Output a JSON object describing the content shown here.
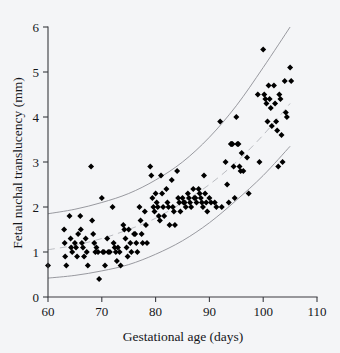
{
  "figure": {
    "background_color": "#f4f5f7",
    "point_color": "#000000",
    "curve_color": "#8d8f95",
    "axis_color": "#3a3b40"
  },
  "axes": {
    "x_title": "Gestational age (days)",
    "y_title": "Fetal nuchal translucency (mm)",
    "x_ticks": [
      "60",
      "70",
      "80",
      "90",
      "100",
      "110"
    ],
    "y_ticks": [
      "0",
      "1",
      "2",
      "3",
      "4",
      "5",
      "6"
    ]
  },
  "chart_data": {
    "type": "scatter",
    "title": "",
    "xlabel": "Gestational age (days)",
    "ylabel": "Fetal nuchal translucency (mm)",
    "xlim": [
      60,
      110
    ],
    "ylim": [
      0,
      6
    ],
    "xticks": [
      60,
      70,
      80,
      90,
      100,
      110
    ],
    "yticks": [
      0,
      1,
      2,
      3,
      4,
      5,
      6
    ],
    "grid": false,
    "legend": null,
    "marker": "diamond",
    "marker_color": "#000000",
    "points": [
      [
        60.0,
        0.7
      ],
      [
        63.0,
        1.5
      ],
      [
        63.1,
        1.2
      ],
      [
        63.2,
        0.9
      ],
      [
        63.4,
        0.7
      ],
      [
        64.0,
        1.8
      ],
      [
        64.2,
        1.3
      ],
      [
        64.3,
        1.1
      ],
      [
        64.5,
        1.0
      ],
      [
        65.0,
        1.2
      ],
      [
        65.2,
        1.1
      ],
      [
        65.4,
        0.9
      ],
      [
        65.6,
        1.4
      ],
      [
        66.0,
        1.8
      ],
      [
        66.1,
        1.5
      ],
      [
        66.3,
        1.2
      ],
      [
        66.5,
        1.1
      ],
      [
        66.7,
        0.9
      ],
      [
        67.0,
        1.3
      ],
      [
        67.2,
        1.0
      ],
      [
        67.4,
        0.7
      ],
      [
        68.0,
        2.9
      ],
      [
        68.2,
        1.7
      ],
      [
        68.4,
        1.4
      ],
      [
        68.6,
        1.2
      ],
      [
        68.8,
        1.0
      ],
      [
        69.0,
        1.1
      ],
      [
        69.3,
        1.0
      ],
      [
        69.5,
        0.4
      ],
      [
        70.0,
        2.2
      ],
      [
        70.2,
        1.0
      ],
      [
        70.4,
        1.0
      ],
      [
        70.6,
        0.7
      ],
      [
        71.0,
        1.3
      ],
      [
        71.2,
        1.0
      ],
      [
        71.5,
        1.0
      ],
      [
        72.0,
        2.0
      ],
      [
        72.2,
        1.2
      ],
      [
        72.4,
        1.1
      ],
      [
        72.6,
        1.0
      ],
      [
        72.8,
        0.8
      ],
      [
        73.0,
        1.1
      ],
      [
        73.3,
        1.0
      ],
      [
        73.5,
        0.7
      ],
      [
        74.0,
        1.6
      ],
      [
        74.2,
        1.5
      ],
      [
        74.4,
        1.3
      ],
      [
        74.6,
        1.1
      ],
      [
        74.8,
        0.9
      ],
      [
        75.0,
        1.5
      ],
      [
        75.3,
        1.2
      ],
      [
        75.5,
        1.0
      ],
      [
        76.0,
        1.4
      ],
      [
        76.2,
        1.4
      ],
      [
        76.4,
        1.2
      ],
      [
        76.6,
        1.0
      ],
      [
        77.0,
        2.0
      ],
      [
        77.2,
        1.7
      ],
      [
        77.4,
        1.4
      ],
      [
        77.6,
        1.2
      ],
      [
        78.0,
        1.9
      ],
      [
        78.2,
        1.6
      ],
      [
        78.4,
        1.2
      ],
      [
        79.0,
        2.9
      ],
      [
        79.2,
        2.7
      ],
      [
        79.4,
        2.2
      ],
      [
        79.6,
        2.0
      ],
      [
        79.8,
        1.9
      ],
      [
        80.0,
        2.3
      ],
      [
        80.2,
        2.1
      ],
      [
        80.4,
        2.0
      ],
      [
        80.6,
        1.8
      ],
      [
        80.8,
        1.7
      ],
      [
        81.0,
        2.7
      ],
      [
        81.2,
        2.3
      ],
      [
        81.4,
        2.0
      ],
      [
        81.6,
        1.8
      ],
      [
        82.0,
        2.4
      ],
      [
        82.2,
        2.1
      ],
      [
        82.4,
        2.0
      ],
      [
        82.6,
        1.6
      ],
      [
        83.0,
        2.6
      ],
      [
        83.2,
        2.0
      ],
      [
        83.4,
        1.9
      ],
      [
        83.6,
        1.6
      ],
      [
        84.0,
        2.8
      ],
      [
        84.2,
        2.2
      ],
      [
        84.4,
        2.1
      ],
      [
        84.6,
        1.9
      ],
      [
        85.0,
        2.2
      ],
      [
        85.2,
        2.1
      ],
      [
        85.4,
        2.1
      ],
      [
        85.6,
        2.0
      ],
      [
        86.0,
        2.3
      ],
      [
        86.2,
        2.2
      ],
      [
        86.4,
        2.1
      ],
      [
        86.6,
        2.0
      ],
      [
        87.0,
        2.4
      ],
      [
        87.2,
        2.2
      ],
      [
        87.4,
        2.2
      ],
      [
        87.6,
        2.1
      ],
      [
        88.0,
        2.4
      ],
      [
        88.2,
        2.3
      ],
      [
        88.4,
        2.2
      ],
      [
        88.6,
        2.1
      ],
      [
        88.8,
        2.0
      ],
      [
        89.0,
        2.7
      ],
      [
        89.2,
        2.3
      ],
      [
        89.4,
        2.1
      ],
      [
        89.6,
        1.9
      ],
      [
        90.0,
        2.2
      ],
      [
        90.3,
        2.1
      ],
      [
        91.0,
        2.1
      ],
      [
        91.3,
        2.0
      ],
      [
        92.0,
        3.9
      ],
      [
        92.3,
        2.0
      ],
      [
        93.0,
        3.0
      ],
      [
        93.3,
        2.5
      ],
      [
        93.6,
        2.1
      ],
      [
        94.0,
        3.4
      ],
      [
        94.1,
        3.4
      ],
      [
        94.3,
        3.4
      ],
      [
        94.5,
        2.9
      ],
      [
        94.7,
        2.2
      ],
      [
        95.0,
        4.0
      ],
      [
        95.2,
        3.4
      ],
      [
        95.4,
        3.4
      ],
      [
        95.6,
        2.9
      ],
      [
        95.8,
        2.8
      ],
      [
        96.0,
        3.2
      ],
      [
        96.3,
        2.8
      ],
      [
        97.0,
        3.1
      ],
      [
        97.3,
        2.3
      ],
      [
        99.0,
        4.5
      ],
      [
        99.3,
        3.0
      ],
      [
        100.0,
        5.5
      ],
      [
        100.2,
        4.5
      ],
      [
        100.4,
        4.4
      ],
      [
        100.6,
        4.3
      ],
      [
        100.8,
        3.9
      ],
      [
        101.0,
        4.7
      ],
      [
        101.2,
        4.4
      ],
      [
        101.4,
        4.2
      ],
      [
        101.6,
        3.8
      ],
      [
        102.0,
        4.7
      ],
      [
        102.2,
        4.3
      ],
      [
        102.4,
        3.9
      ],
      [
        102.6,
        3.7
      ],
      [
        102.8,
        2.9
      ],
      [
        103.0,
        4.5
      ],
      [
        103.2,
        4.4
      ],
      [
        103.4,
        3.6
      ],
      [
        103.6,
        3.0
      ],
      [
        104.0,
        4.8
      ],
      [
        104.2,
        4.1
      ],
      [
        104.4,
        4.0
      ],
      [
        105.0,
        5.1
      ],
      [
        105.2,
        4.8
      ]
    ],
    "reference_curves": [
      {
        "name": "upper-boundary",
        "style": "solid",
        "color": "#8d8f95",
        "x": [
          60,
          65,
          70,
          75,
          80,
          85,
          90,
          95,
          100,
          105
        ],
        "y": [
          1.85,
          1.95,
          2.1,
          2.3,
          2.6,
          3.0,
          3.55,
          4.25,
          5.1,
          6.0
        ]
      },
      {
        "name": "median",
        "style": "dashed",
        "color": "#b0b2b8",
        "x": [
          60,
          65,
          70,
          75,
          80,
          85,
          90,
          95,
          100,
          105
        ],
        "y": [
          1.05,
          1.15,
          1.3,
          1.5,
          1.75,
          2.1,
          2.5,
          3.0,
          3.6,
          4.3
        ]
      },
      {
        "name": "lower-boundary",
        "style": "solid",
        "color": "#8d8f95",
        "x": [
          60,
          65,
          70,
          75,
          80,
          85,
          90,
          95,
          100,
          105
        ],
        "y": [
          0.42,
          0.48,
          0.58,
          0.72,
          0.95,
          1.25,
          1.65,
          2.15,
          2.7,
          3.35
        ]
      }
    ]
  }
}
